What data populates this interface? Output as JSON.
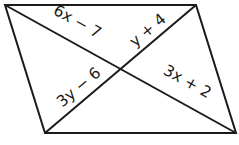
{
  "figure": {
    "type": "parallelogram-with-diagonals",
    "vertices": {
      "top_left": [
        5,
        5
      ],
      "top_right": [
        196,
        5
      ],
      "bottom_right": [
        236,
        133
      ],
      "bottom_left": [
        45,
        133
      ]
    },
    "intersection": [
      121,
      69
    ],
    "stroke_color": "#1a1a1a",
    "labels": [
      {
        "id": "seg-tl",
        "text": "6x − 7",
        "x": 75,
        "y": 26,
        "angle": 29
      },
      {
        "id": "seg-tr",
        "text": "y + 4",
        "x": 151,
        "y": 34,
        "angle": -40
      },
      {
        "id": "seg-bl",
        "text": "3y − 6",
        "x": 82,
        "y": 91,
        "angle": -40
      },
      {
        "id": "seg-br",
        "text": "3x + 2",
        "x": 185,
        "y": 86,
        "angle": 29
      }
    ]
  }
}
